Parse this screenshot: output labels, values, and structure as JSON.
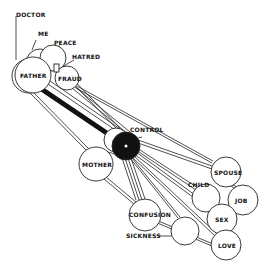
{
  "diagram": {
    "type": "network",
    "nodes": [
      {
        "id": "father",
        "label": "FATHER",
        "x": 33,
        "y": 75,
        "r": 18
      },
      {
        "id": "me",
        "label": "ME",
        "x": 40,
        "y": 63,
        "r": 14
      },
      {
        "id": "peace",
        "label": "PEACE",
        "x": 53,
        "y": 58,
        "r": 13
      },
      {
        "id": "hatred",
        "label": "HATRED",
        "x": 56,
        "y": 70,
        "r": 3
      },
      {
        "id": "fraud",
        "label": "FRAUD",
        "x": 67,
        "y": 78,
        "r": 12
      },
      {
        "id": "doctor",
        "label": "DOCTOR",
        "x": 18,
        "y": 75,
        "r": 18
      },
      {
        "id": "control",
        "label": "CONTROL",
        "x": 126,
        "y": 146,
        "r": 14
      },
      {
        "id": "mother",
        "label": "MOTHER",
        "x": 96,
        "y": 164,
        "r": 17
      },
      {
        "id": "spouse",
        "label": "SPOUSE",
        "x": 226,
        "y": 172,
        "r": 15
      },
      {
        "id": "child",
        "label": "CHILD",
        "x": 206,
        "y": 198,
        "r": 14
      },
      {
        "id": "job",
        "label": "JOB",
        "x": 243,
        "y": 200,
        "r": 15
      },
      {
        "id": "sex",
        "label": "SEX",
        "x": 222,
        "y": 219,
        "r": 15
      },
      {
        "id": "confusion",
        "label": "CONFUSION",
        "x": 145,
        "y": 215,
        "r": 16
      },
      {
        "id": "sickness",
        "label": "SICKNESS",
        "x": 185,
        "y": 231,
        "r": 14
      },
      {
        "id": "love",
        "label": "LOVE",
        "x": 226,
        "y": 245,
        "r": 15
      }
    ],
    "labels": {
      "doctor": "DOCTOR",
      "me": "ME",
      "peace": "PEACE",
      "hatred": "HATRED",
      "father": "FATHER",
      "fraud": "FRAUD",
      "control": "CONTROL",
      "mother": "MOTHER",
      "spouse": "SPOUSE",
      "child": "CHILD",
      "job": "JOB",
      "sex": "SEX",
      "confusion": "CONFUSION",
      "sickness": "SICKNESS",
      "love": "LOVE"
    }
  }
}
